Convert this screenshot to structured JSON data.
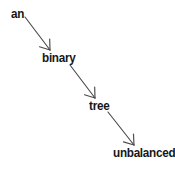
{
  "diagram": {
    "type": "sentence-dependency-chain",
    "background_color": "#ffffff",
    "text_color": "#161616",
    "arrow_color": "#4a4a4a",
    "nodes": [
      {
        "id": "an",
        "label": "an",
        "x": 11,
        "y": 7
      },
      {
        "id": "binary",
        "label": "binary",
        "x": 42,
        "y": 51
      },
      {
        "id": "tree",
        "label": "tree",
        "x": 89,
        "y": 99
      },
      {
        "id": "unbalanced",
        "label": "unbalanced",
        "x": 113,
        "y": 146
      }
    ],
    "arrows": [
      {
        "id": "an-to-binary",
        "from": "an",
        "to": "binary",
        "x1": 25,
        "y1": 17,
        "x2": 50,
        "y2": 50
      },
      {
        "id": "binary-to-tree",
        "from": "binary",
        "to": "tree",
        "x1": 70,
        "y1": 65,
        "x2": 95,
        "y2": 98
      },
      {
        "id": "tree-to-unbalanced",
        "from": "tree",
        "to": "unbalanced",
        "x1": 108,
        "y1": 112,
        "x2": 134,
        "y2": 145
      }
    ]
  }
}
